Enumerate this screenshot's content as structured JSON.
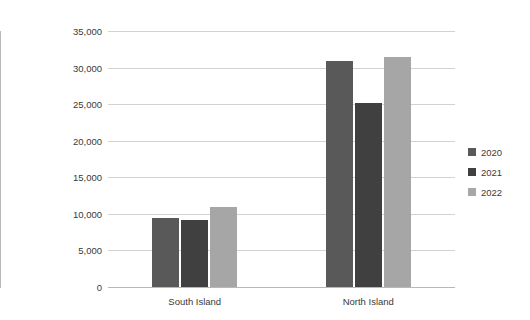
{
  "chart_data": {
    "type": "bar",
    "title": "",
    "xlabel": "",
    "ylabel": "Number of seatbelt offences",
    "categories": [
      "South Island",
      "North Island"
    ],
    "series": [
      {
        "name": "2020",
        "color": "#595959",
        "values": [
          9400,
          30900
        ]
      },
      {
        "name": "2021",
        "color": "#404040",
        "values": [
          9200,
          25100
        ]
      },
      {
        "name": "2022",
        "color": "#a6a6a6",
        "values": [
          10900,
          31400
        ]
      }
    ],
    "ylim": [
      0,
      35000
    ],
    "ytick_values": [
      0,
      5000,
      10000,
      15000,
      20000,
      25000,
      30000,
      35000
    ],
    "ytick_labels": [
      "0",
      "5,000",
      "10,000",
      "15,000",
      "20,000",
      "25,000",
      "30,000",
      "35,000"
    ],
    "grid": true,
    "grid_axis": "y",
    "legend_position": "right",
    "legend_entries": [
      "2020",
      "2021",
      "2022"
    ],
    "background_color": "#ffffff",
    "gridline_color": "#d2d2d2",
    "axis_color": "#b8b8b8",
    "text_color": "#3a3a3a"
  }
}
